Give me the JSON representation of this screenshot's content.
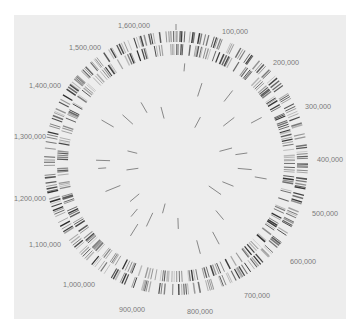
{
  "figure": {
    "type": "circular-genome-map",
    "panel_color": "#ededed",
    "page_color": "#ffffff",
    "center": [
      176,
      163
    ],
    "genome_length": 1650000,
    "tracks": [
      {
        "name": "forward-strand-genes",
        "r_inner": 121,
        "r_outer": 132,
        "color": "#2a2a2a"
      },
      {
        "name": "reverse-strand-genes",
        "r_inner": 108,
        "r_outer": 119,
        "color": "#2a2a2a"
      },
      {
        "name": "inner-features",
        "r_inner": 20,
        "r_outer": 100,
        "color": "#555555"
      }
    ],
    "position_labels": [
      {
        "text": "100,000",
        "x": 235,
        "y": 34
      },
      {
        "text": "200,000",
        "x": 286,
        "y": 65
      },
      {
        "text": "300,000",
        "x": 318,
        "y": 109
      },
      {
        "text": "400,000",
        "x": 330,
        "y": 162
      },
      {
        "text": "500,000",
        "x": 325,
        "y": 216
      },
      {
        "text": "600,000",
        "x": 303,
        "y": 264
      },
      {
        "text": "700,000",
        "x": 257,
        "y": 298
      },
      {
        "text": "800,000",
        "x": 200,
        "y": 314
      },
      {
        "text": "900,000",
        "x": 132,
        "y": 312
      },
      {
        "text": "1,000,000",
        "x": 79,
        "y": 287
      },
      {
        "text": "1,100,000",
        "x": 45,
        "y": 247
      },
      {
        "text": "1,200,000",
        "x": 30,
        "y": 201
      },
      {
        "text": "1,300,000",
        "x": 30,
        "y": 139
      },
      {
        "text": "1,400,000",
        "x": 45,
        "y": 88
      },
      {
        "text": "1,500,000",
        "x": 85,
        "y": 50
      },
      {
        "text": "1,600,000",
        "x": 134,
        "y": 28
      }
    ],
    "inner_features": [
      {
        "angle": 5,
        "r1": 92,
        "r2": 100
      },
      {
        "angle": 18,
        "r1": 70,
        "r2": 84
      },
      {
        "angle": 28,
        "r1": 40,
        "r2": 52
      },
      {
        "angle": 38,
        "r1": 78,
        "r2": 92
      },
      {
        "angle": 52,
        "r1": 60,
        "r2": 74
      },
      {
        "angle": 62,
        "r1": 85,
        "r2": 97
      },
      {
        "angle": 75,
        "r1": 45,
        "r2": 58
      },
      {
        "angle": 82,
        "r1": 60,
        "r2": 72
      },
      {
        "angle": 95,
        "r1": 62,
        "r2": 76
      },
      {
        "angle": 100,
        "r1": 80,
        "r2": 92
      },
      {
        "angle": 112,
        "r1": 50,
        "r2": 62
      },
      {
        "angle": 125,
        "r1": 40,
        "r2": 55
      },
      {
        "angle": 140,
        "r1": 62,
        "r2": 74
      },
      {
        "angle": 152,
        "r1": 78,
        "r2": 92
      },
      {
        "angle": 165,
        "r1": 80,
        "r2": 94
      },
      {
        "angle": 178,
        "r1": 55,
        "r2": 66
      },
      {
        "angle": 195,
        "r1": 42,
        "r2": 52
      },
      {
        "angle": 205,
        "r1": 55,
        "r2": 70
      },
      {
        "angle": 212,
        "r1": 72,
        "r2": 86
      },
      {
        "angle": 220,
        "r1": 60,
        "r2": 70
      },
      {
        "angle": 230,
        "r1": 48,
        "r2": 60
      },
      {
        "angle": 248,
        "r1": 60,
        "r2": 76
      },
      {
        "angle": 262,
        "r1": 38,
        "r2": 50
      },
      {
        "angle": 266,
        "r1": 70,
        "r2": 78
      },
      {
        "angle": 272,
        "r1": 66,
        "r2": 80
      },
      {
        "angle": 284,
        "r1": 40,
        "r2": 50
      },
      {
        "angle": 300,
        "r1": 72,
        "r2": 86
      },
      {
        "angle": 312,
        "r1": 58,
        "r2": 72
      },
      {
        "angle": 330,
        "r1": 58,
        "r2": 70
      },
      {
        "angle": 345,
        "r1": 46,
        "r2": 58
      }
    ],
    "origin_tick": {
      "angle": 0,
      "r1": 133,
      "r2": 139
    }
  }
}
